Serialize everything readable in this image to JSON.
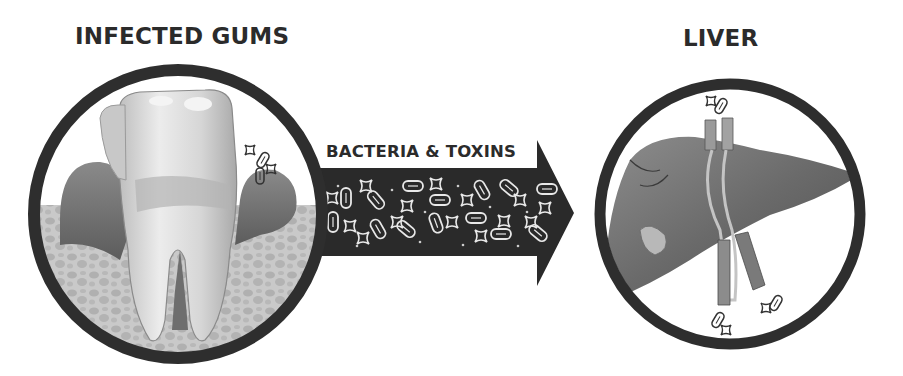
{
  "diagram": {
    "left_panel": {
      "title": "INFECTED GUMS",
      "illustration": "molar tooth with inflamed gums and bacteria"
    },
    "connector": {
      "label": "BACTERIA & TOXINS",
      "direction": "left-to-right",
      "contents": "bacteria and toxin particles"
    },
    "right_panel": {
      "title": "LIVER",
      "illustration": "liver with blood vessels and bacteria"
    },
    "colors": {
      "ring": "#2e2e2e",
      "arrow": "#2a2a2a",
      "text": "#2b2b2b",
      "background": "#ffffff"
    }
  }
}
